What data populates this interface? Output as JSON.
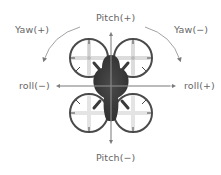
{
  "diagram": {
    "labels": {
      "pitch_plus": "Pitch(+)",
      "pitch_minus": "Pitch(−)",
      "yaw_plus": "Yaw(+)",
      "yaw_minus": "Yaw(−)",
      "roll_minus": "roll(−)",
      "roll_plus": "roll(+)"
    },
    "colors": {
      "body": "#3a3a3a",
      "propeller_guard": "#4a4a4a",
      "propeller_blade": "#e0e0e0",
      "arrow": "#8a8a8a",
      "text": "#666666"
    }
  }
}
